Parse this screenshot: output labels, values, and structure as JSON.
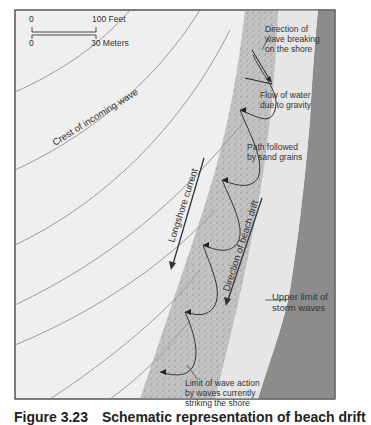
{
  "figure": {
    "scale": {
      "feet_start": "0",
      "feet_end": "100 Feet",
      "meters_start": "0",
      "meters_end": "30 Meters"
    },
    "labels": {
      "crest": "Crest  of  incoming  wave",
      "direction_breaking": [
        "Direction of",
        "wave breaking",
        "on the shore"
      ],
      "flow_gravity": [
        "Flow of water",
        "due to gravity"
      ],
      "path_sand": [
        "Path followed",
        "by sand grains"
      ],
      "longshore": "Longshore current",
      "beach_drift": "Direction of beach drift",
      "storm": [
        "Upper limit of",
        "storm waves"
      ],
      "limit_wave": [
        "Limit of wave action",
        "by waves currently",
        "striking the shore"
      ]
    },
    "colors": {
      "water": "#f0f0f0",
      "surf_zone": "#bdbdbd",
      "beach": "#e4e4e4",
      "land": "#8c8c8c",
      "wave_lines": "#9a9a9a",
      "arrows": "#333333"
    }
  },
  "caption": {
    "figure_number": "Figure 3.23",
    "text": "Schematic representation of beach drift"
  }
}
